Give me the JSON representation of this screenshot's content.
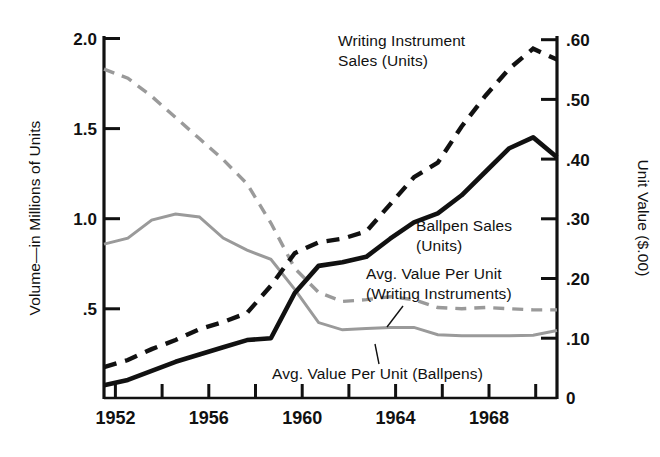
{
  "chart_data": {
    "type": "line",
    "title": "",
    "xlabel": "",
    "ylabel": "Volume—in Millions of Units",
    "y2label": "Unit Value ($.00)",
    "xlim": [
      1951,
      1970
    ],
    "ylim": [
      0,
      2.0
    ],
    "y2lim": [
      0,
      0.6
    ],
    "grid": false,
    "legend_position": "inline-annotations",
    "x_tick_labels": [
      "1952",
      "1956",
      "1960",
      "1964",
      "1968"
    ],
    "x_tick_values": [
      1952,
      1956,
      1960,
      1964,
      1968
    ],
    "x_minor_ticks": [
      1954,
      1958,
      1962,
      1966,
      1970
    ],
    "y_tick_labels": [
      "2.0",
      "1.5",
      "1.0",
      ".5"
    ],
    "y_tick_values": [
      2.0,
      1.5,
      1.0,
      0.5
    ],
    "y2_tick_labels": [
      ".60",
      ".50",
      ".40",
      ".30",
      ".20",
      ".10",
      "0"
    ],
    "y2_tick_values": [
      0.6,
      0.5,
      0.4,
      0.3,
      0.2,
      0.1,
      0
    ],
    "x": [
      1951,
      1952,
      1953,
      1954,
      1955,
      1956,
      1957,
      1958,
      1959,
      1960,
      1961,
      1962,
      1963,
      1964,
      1965,
      1966,
      1967,
      1968,
      1969,
      1970
    ],
    "series": [
      {
        "name": "Writing Instrument Sales (Units)",
        "axis": "left",
        "style": "dashed",
        "color": "#111111",
        "values": [
          0.17,
          0.21,
          0.27,
          0.32,
          0.38,
          0.42,
          0.47,
          0.62,
          0.8,
          0.86,
          0.88,
          0.92,
          1.07,
          1.22,
          1.3,
          1.5,
          1.67,
          1.82,
          1.93,
          1.87
        ]
      },
      {
        "name": "Ballpen Sales (Units)",
        "axis": "left",
        "style": "solid",
        "color": "#111111",
        "values": [
          0.07,
          0.1,
          0.15,
          0.2,
          0.24,
          0.28,
          0.32,
          0.33,
          0.58,
          0.73,
          0.75,
          0.78,
          0.88,
          0.97,
          1.02,
          1.12,
          1.25,
          1.38,
          1.44,
          1.33
        ]
      },
      {
        "name": "Avg. Value Per Unit (Writing Instruments)",
        "axis": "right",
        "style": "dashed",
        "color": "#9a9a9a",
        "values": [
          0.545,
          0.53,
          0.5,
          0.465,
          0.43,
          0.395,
          0.355,
          0.29,
          0.215,
          0.175,
          0.16,
          0.163,
          0.168,
          0.163,
          0.15,
          0.148,
          0.15,
          0.148,
          0.146,
          0.146
        ]
      },
      {
        "name": "Avg. Value Per Unit (Ballpens)",
        "axis": "right",
        "style": "solid",
        "color": "#9a9a9a",
        "values": [
          0.255,
          0.265,
          0.295,
          0.305,
          0.3,
          0.265,
          0.245,
          0.23,
          0.18,
          0.125,
          0.113,
          0.115,
          0.117,
          0.117,
          0.105,
          0.103,
          0.103,
          0.103,
          0.104,
          0.112
        ]
      }
    ],
    "annotations": [
      {
        "id": "writing-instrument-sales",
        "text_line1": "Writing Instrument",
        "text_line2": "Sales (Units)"
      },
      {
        "id": "ballpen-sales",
        "text_line1": "Ballpen Sales",
        "text_line2": "(Units)"
      },
      {
        "id": "avg-value-writing",
        "text_line1": "Avg. Value Per Unit",
        "text_line2": "(Writing Instruments)"
      },
      {
        "id": "avg-value-ballpens",
        "text_line1": "Avg. Value Per Unit  (Ballpens)",
        "text_line2": ""
      }
    ]
  },
  "axes": {
    "left_title": "Volume—in Millions of Units",
    "right_title": "Unit Value ($.00)"
  },
  "labels": {
    "y_2_0": "2.0",
    "y_1_5": "1.5",
    "y_1_0": "1.0",
    "y_0_5": ".5",
    "y2_60": ".60",
    "y2_50": ".50",
    "y2_40": ".40",
    "y2_30": ".30",
    "y2_20": ".20",
    "y2_10": ".10",
    "y2_0": "0",
    "x_1952": "1952",
    "x_1956": "1956",
    "x_1960": "1960",
    "x_1964": "1964",
    "x_1968": "1968"
  },
  "annotations": {
    "wi_line1": "Writing Instrument",
    "wi_line2": "Sales (Units)",
    "bp_line1": "Ballpen Sales",
    "bp_line2": "(Units)",
    "avw_line1": "Avg. Value Per Unit",
    "avw_line2": "(Writing Instruments)",
    "avb_line1": "Avg. Value Per Unit  (Ballpens)"
  }
}
